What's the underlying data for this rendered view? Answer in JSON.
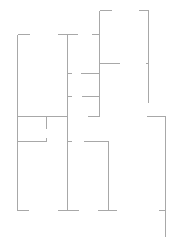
{
  "diagram": {
    "type": "floor-plan-wall-lines",
    "stroke_color": "#a8a8a8",
    "background": "#ffffff",
    "segments": [
      {
        "id": "left-outer-wall",
        "x1": 17,
        "y1": 34,
        "x2": 17,
        "y2": 210
      },
      {
        "id": "left-top-cap",
        "x1": 17,
        "y1": 34,
        "x2": 29,
        "y2": 34
      },
      {
        "id": "mid-top-cap",
        "x1": 57,
        "y1": 34,
        "x2": 77,
        "y2": 34
      },
      {
        "id": "mid-wall",
        "x1": 67,
        "y1": 34,
        "x2": 67,
        "y2": 210
      },
      {
        "id": "mid-tick-1",
        "x1": 67,
        "y1": 73,
        "x2": 71,
        "y2": 73
      },
      {
        "id": "mid-tick-2",
        "x1": 67,
        "y1": 96,
        "x2": 71,
        "y2": 96
      },
      {
        "id": "small-top-tick",
        "x1": 91,
        "y1": 34,
        "x2": 99,
        "y2": 34
      },
      {
        "id": "tower-left-wall",
        "x1": 99,
        "y1": 10,
        "x2": 99,
        "y2": 116
      },
      {
        "id": "tower-top-left-cap",
        "x1": 99,
        "y1": 10,
        "x2": 111,
        "y2": 10
      },
      {
        "id": "tower-top-right-cap",
        "x1": 138,
        "y1": 10,
        "x2": 148,
        "y2": 10
      },
      {
        "id": "tower-right-wall",
        "x1": 148,
        "y1": 10,
        "x2": 148,
        "y2": 102
      },
      {
        "id": "tower-mid-shelf",
        "x1": 99,
        "y1": 63,
        "x2": 119,
        "y2": 63
      },
      {
        "id": "tower-right-tick",
        "x1": 145,
        "y1": 63,
        "x2": 148,
        "y2": 63
      },
      {
        "id": "corridor-line-1",
        "x1": 80,
        "y1": 73,
        "x2": 99,
        "y2": 73
      },
      {
        "id": "corridor-line-2",
        "x1": 81,
        "y1": 96,
        "x2": 99,
        "y2": 96
      },
      {
        "id": "room-divider-top",
        "x1": 17,
        "y1": 116,
        "x2": 67,
        "y2": 116
      },
      {
        "id": "room-divider-stub",
        "x1": 46,
        "y1": 116,
        "x2": 46,
        "y2": 128
      },
      {
        "id": "room-shelf-left",
        "x1": 17,
        "y1": 141,
        "x2": 46,
        "y2": 141
      },
      {
        "id": "room-shelf-left-stub",
        "x1": 46,
        "y1": 137,
        "x2": 46,
        "y2": 141
      },
      {
        "id": "right-mid-cap",
        "x1": 87,
        "y1": 116,
        "x2": 99,
        "y2": 116
      },
      {
        "id": "tick-after-mid",
        "x1": 67,
        "y1": 141,
        "x2": 71,
        "y2": 141
      },
      {
        "id": "room-right-top",
        "x1": 83,
        "y1": 141,
        "x2": 108,
        "y2": 141
      },
      {
        "id": "room-right-wall",
        "x1": 108,
        "y1": 141,
        "x2": 108,
        "y2": 210
      },
      {
        "id": "far-right-cap",
        "x1": 146,
        "y1": 116,
        "x2": 165,
        "y2": 116
      },
      {
        "id": "far-right-wall",
        "x1": 165,
        "y1": 116,
        "x2": 165,
        "y2": 237
      },
      {
        "id": "foot-left",
        "x1": 17,
        "y1": 210,
        "x2": 28,
        "y2": 210
      },
      {
        "id": "foot-mid",
        "x1": 57,
        "y1": 210,
        "x2": 78,
        "y2": 210
      },
      {
        "id": "foot-third",
        "x1": 97,
        "y1": 210,
        "x2": 116,
        "y2": 210
      },
      {
        "id": "foot-right-tick",
        "x1": 158,
        "y1": 210,
        "x2": 165,
        "y2": 210
      }
    ]
  }
}
